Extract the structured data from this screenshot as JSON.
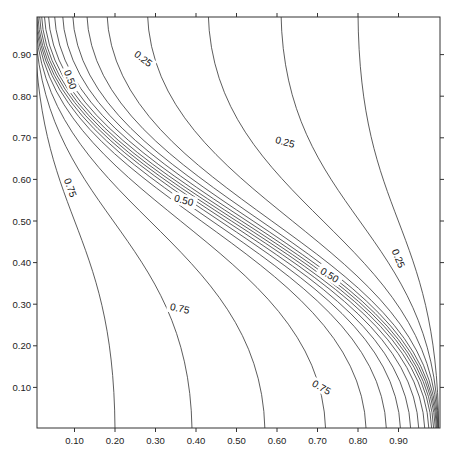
{
  "chart_data": {
    "type": "contour",
    "title": "",
    "xlabel": "",
    "ylabel": "",
    "xlim": [
      0.0,
      1.0
    ],
    "ylim": [
      0.0,
      1.0
    ],
    "grid": false,
    "x_ticks": [
      "0.10",
      "0.20",
      "0.30",
      "0.40",
      "0.50",
      "0.60",
      "0.70",
      "0.80",
      "0.90"
    ],
    "y_ticks": [
      "0.10",
      "0.20",
      "0.30",
      "0.40",
      "0.50",
      "0.60",
      "0.70",
      "0.80",
      "0.90"
    ],
    "contour_levels": [
      0.05,
      0.1,
      0.15,
      0.2,
      0.25,
      0.3,
      0.35,
      0.4,
      0.45,
      0.5,
      0.55,
      0.6,
      0.65,
      0.7,
      0.75,
      0.8,
      0.85,
      0.9,
      0.95
    ],
    "contour_top_entry_x": [
      0.8,
      0.61,
      0.43,
      0.28,
      0.18,
      0.13,
      0.095,
      0.07,
      0.05,
      0.035,
      0.025,
      0.018,
      0.013,
      0.009,
      0.006,
      0.004,
      0.0025,
      0.0015,
      0.0007
    ],
    "contour_bottom_exit_x": [
      0.9993,
      0.9985,
      0.9975,
      0.996,
      0.994,
      0.991,
      0.987,
      0.982,
      0.975,
      0.965,
      0.95,
      0.93,
      0.905,
      0.87,
      0.82,
      0.72,
      0.57,
      0.39,
      0.2
    ],
    "labeled_levels": [
      {
        "text": "0.25",
        "x": 0.27,
        "y": 0.89,
        "angle": 38
      },
      {
        "text": "0.25",
        "x": 0.62,
        "y": 0.69,
        "angle": 15
      },
      {
        "text": "0.25",
        "x": 0.9,
        "y": 0.41,
        "angle": 68
      },
      {
        "text": "0.50",
        "x": 0.09,
        "y": 0.84,
        "angle": 70
      },
      {
        "text": "0.50",
        "x": 0.37,
        "y": 0.55,
        "angle": 15
      },
      {
        "text": "0.50",
        "x": 0.73,
        "y": 0.37,
        "angle": 32
      },
      {
        "text": "0.75",
        "x": 0.09,
        "y": 0.58,
        "angle": 70
      },
      {
        "text": "0.75",
        "x": 0.36,
        "y": 0.29,
        "angle": 12
      },
      {
        "text": "0.75",
        "x": 0.71,
        "y": 0.1,
        "angle": 30
      }
    ],
    "line_color": "#333333"
  }
}
